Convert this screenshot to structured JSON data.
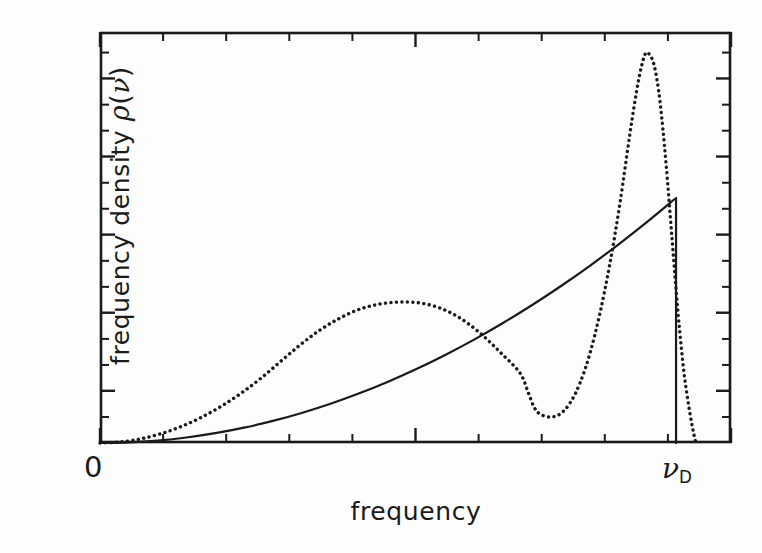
{
  "figure": {
    "background_color": "#fdfdfd",
    "ink_color": "#1a1a1a"
  },
  "labels": {
    "ylabel_prefix": "frequency density ",
    "ylabel_rho": "ρ",
    "ylabel_open_paren": "(",
    "ylabel_nu": "ν",
    "ylabel_close_paren": ")",
    "xlabel": "frequency",
    "origin": "0",
    "nu_d_symbol": "ν",
    "nu_d_subscript": "D"
  },
  "chart_data": {
    "type": "line",
    "title": "",
    "xlabel": "frequency",
    "ylabel": "frequency density ρ(ν)",
    "xlim": [
      0,
      1.0
    ],
    "ylim": [
      0,
      1.0
    ],
    "xticklabels": [
      "0",
      "ν_D"
    ],
    "xtickvalues": [
      0.0,
      0.9129
    ],
    "yticklabels": [],
    "grid": false,
    "legend": null,
    "axis_style": "box-frame-with-inward-ticks",
    "x_major_ticks": [
      0.0,
      0.5,
      1.0
    ],
    "x_minor_ticks": [
      0.1,
      0.2,
      0.3,
      0.4,
      0.6,
      0.7,
      0.8,
      0.9
    ],
    "y_major_ticks": [
      0.127,
      0.317,
      0.507,
      0.697,
      0.887
    ],
    "y_minor_ticks": [
      0.0632,
      0.1899,
      0.2532,
      0.3799,
      0.4432,
      0.5699,
      0.6332,
      0.7599,
      0.8232,
      0.9499
    ],
    "series": [
      {
        "name": "Debye density of states",
        "style": "solid",
        "linewidth": 2.2,
        "description": "parabolic nu-squared rising curve truncated vertically at the Debye frequency",
        "points": [
          [
            0.0,
            0.0
          ],
          [
            0.0457,
            0.0015
          ],
          [
            0.0913,
            0.006
          ],
          [
            0.137,
            0.0134
          ],
          [
            0.1826,
            0.0239
          ],
          [
            0.2283,
            0.0373
          ],
          [
            0.274,
            0.0537
          ],
          [
            0.3196,
            0.0731
          ],
          [
            0.3653,
            0.0955
          ],
          [
            0.411,
            0.1209
          ],
          [
            0.4566,
            0.1492
          ],
          [
            0.5023,
            0.1806
          ],
          [
            0.5479,
            0.2149
          ],
          [
            0.5936,
            0.2522
          ],
          [
            0.6393,
            0.2925
          ],
          [
            0.6849,
            0.3357
          ],
          [
            0.7306,
            0.382
          ],
          [
            0.7763,
            0.4312
          ],
          [
            0.8219,
            0.4834
          ],
          [
            0.8676,
            0.5386
          ],
          [
            0.9129,
            0.5961
          ],
          [
            0.9129,
            0.0
          ]
        ]
      },
      {
        "name": "Realistic phonon density of states",
        "style": "dotted",
        "linewidth": 3.4,
        "description": "double-peaked curve with a broad low-frequency hump, a deep valley, a tall narrow van Hove peak and a sharp cut-off",
        "points": [
          [
            0.0,
            0.0
          ],
          [
            0.0317,
            0.0024
          ],
          [
            0.0634,
            0.0097
          ],
          [
            0.0951,
            0.0219
          ],
          [
            0.1268,
            0.0389
          ],
          [
            0.1584,
            0.0608
          ],
          [
            0.1901,
            0.0876
          ],
          [
            0.2218,
            0.1192
          ],
          [
            0.2535,
            0.1557
          ],
          [
            0.2852,
            0.197
          ],
          [
            0.3169,
            0.2383
          ],
          [
            0.3486,
            0.2748
          ],
          [
            0.3803,
            0.304
          ],
          [
            0.412,
            0.3259
          ],
          [
            0.4437,
            0.3381
          ],
          [
            0.4754,
            0.343
          ],
          [
            0.5071,
            0.3406
          ],
          [
            0.5388,
            0.3284
          ],
          [
            0.5705,
            0.3041
          ],
          [
            0.6022,
            0.2676
          ],
          [
            0.6339,
            0.2214
          ],
          [
            0.6656,
            0.1703
          ],
          [
            0.6783,
            0.1241
          ],
          [
            0.6878,
            0.0876
          ],
          [
            0.6973,
            0.0705
          ],
          [
            0.7132,
            0.0632
          ],
          [
            0.729,
            0.0705
          ],
          [
            0.7449,
            0.0973
          ],
          [
            0.7607,
            0.146
          ],
          [
            0.7766,
            0.219
          ],
          [
            0.7924,
            0.3163
          ],
          [
            0.8083,
            0.438
          ],
          [
            0.8241,
            0.584
          ],
          [
            0.84,
            0.7543
          ],
          [
            0.8527,
            0.8759
          ],
          [
            0.8622,
            0.9392
          ],
          [
            0.8685,
            0.9489
          ],
          [
            0.8781,
            0.9197
          ],
          [
            0.8876,
            0.8297
          ],
          [
            0.897,
            0.6813
          ],
          [
            0.9066,
            0.4964
          ],
          [
            0.9161,
            0.3163
          ],
          [
            0.9256,
            0.1703
          ],
          [
            0.9351,
            0.0705
          ],
          [
            0.9414,
            0.0195
          ],
          [
            0.9446,
            0.0
          ]
        ]
      }
    ],
    "annotations": [
      {
        "text": "0",
        "x": 0.0,
        "y": 0.0,
        "placement": "below-left-of-origin"
      },
      {
        "text": "ν_D",
        "x": 0.9129,
        "y": 0.0,
        "placement": "below-axis"
      }
    ]
  }
}
